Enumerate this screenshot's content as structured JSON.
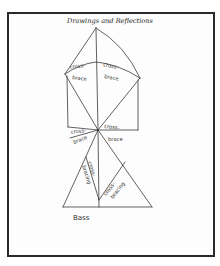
{
  "page": {
    "title": "Drawings and Reflections"
  },
  "drawing": {
    "labels": {
      "upper_left_top": "cross-",
      "upper_left_bottom": "brace",
      "upper_right_top": "cross-",
      "upper_right_bottom": "brace",
      "mid_left_top": "cross-",
      "mid_left_bottom": "brace",
      "mid_right_top": "cross-",
      "mid_right_bottom": "brace",
      "lower_left_top": "cross-",
      "lower_left_bottom": "bracing",
      "lower_right_top": "cross-",
      "lower_right_bottom": "bracing",
      "caption": "Bass"
    },
    "stroke_color": "#3a3a3a"
  }
}
